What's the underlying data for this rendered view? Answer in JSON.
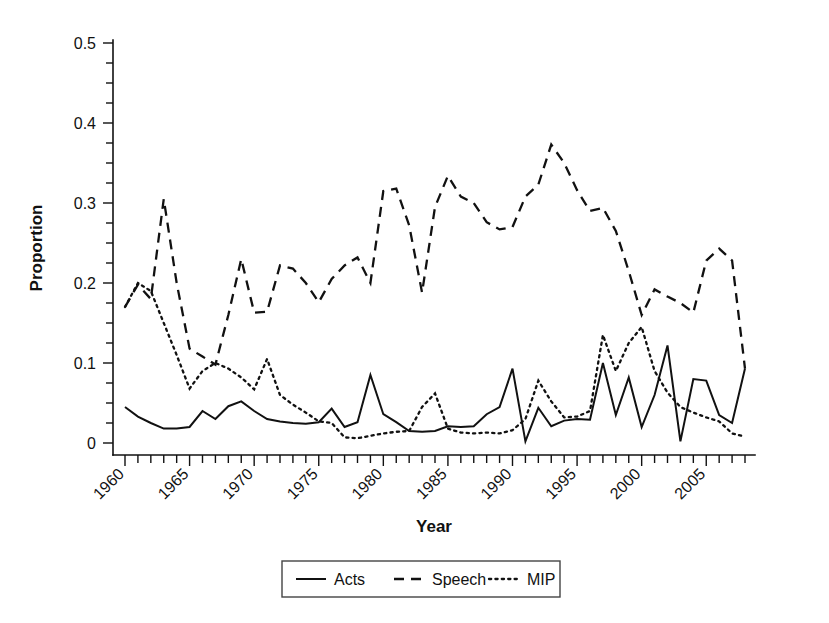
{
  "chart_data": {
    "type": "line",
    "title": "",
    "xlabel": "Year",
    "ylabel": "Proportion",
    "xlim": [
      1960,
      2008
    ],
    "ylim": [
      0,
      0.5
    ],
    "grid": false,
    "legend_position": "bottom",
    "y_ticks": [
      0,
      0.1,
      0.2,
      0.3,
      0.4,
      0.5
    ],
    "y_tick_labels": [
      "0",
      "0.1",
      "0.2",
      "0.3",
      "0.4",
      "0.5"
    ],
    "y_minor_tick_step": 0.025,
    "x_ticks": [
      1960,
      1965,
      1970,
      1975,
      1980,
      1985,
      1990,
      1995,
      2000,
      2005
    ],
    "x_tick_labels": [
      "1960",
      "1965",
      "1970",
      "1975",
      "1980",
      "1985",
      "1990",
      "1995",
      "2000",
      "2005"
    ],
    "x_tick_label_rotation": 45,
    "x_minor_tick_step": 1,
    "x": [
      1960,
      1961,
      1962,
      1963,
      1964,
      1965,
      1966,
      1967,
      1968,
      1969,
      1970,
      1971,
      1972,
      1973,
      1974,
      1975,
      1976,
      1977,
      1978,
      1979,
      1980,
      1981,
      1982,
      1983,
      1984,
      1985,
      1986,
      1987,
      1988,
      1989,
      1990,
      1991,
      1992,
      1993,
      1994,
      1995,
      1996,
      1997,
      1998,
      1999,
      2000,
      2001,
      2002,
      2003,
      2004,
      2005,
      2006,
      2007,
      2008
    ],
    "series": [
      {
        "name": "Acts",
        "style": "solid",
        "values": [
          0.045,
          0.033,
          0.025,
          0.018,
          0.018,
          0.02,
          0.04,
          0.03,
          0.046,
          0.052,
          0.04,
          0.03,
          0.027,
          0.025,
          0.024,
          0.026,
          0.043,
          0.02,
          0.026,
          0.085,
          0.036,
          0.026,
          0.015,
          0.014,
          0.015,
          0.021,
          0.02,
          0.021,
          0.036,
          0.045,
          0.093,
          0.002,
          0.044,
          0.021,
          0.028,
          0.03,
          0.029,
          0.1,
          0.035,
          0.082,
          0.02,
          0.06,
          0.122,
          0.002,
          0.08,
          0.078,
          0.035,
          0.025,
          0.093
        ]
      },
      {
        "name": "Speech",
        "style": "dashed",
        "values": [
          0.17,
          0.198,
          0.18,
          0.305,
          0.2,
          0.118,
          0.108,
          0.098,
          0.16,
          0.23,
          0.163,
          0.164,
          0.222,
          0.218,
          0.2,
          0.176,
          0.205,
          0.222,
          0.232,
          0.2,
          0.315,
          0.318,
          0.272,
          0.188,
          0.295,
          0.334,
          0.308,
          0.3,
          0.276,
          0.267,
          0.27,
          0.308,
          0.323,
          0.373,
          0.35,
          0.316,
          0.29,
          0.294,
          0.265,
          0.215,
          0.16,
          0.192,
          0.183,
          0.175,
          0.163,
          0.228,
          0.243,
          0.228,
          0.093
        ]
      },
      {
        "name": "MIP",
        "style": "dotted",
        "values": [
          0.17,
          0.2,
          0.19,
          0.15,
          0.11,
          0.068,
          0.09,
          0.1,
          0.093,
          0.082,
          0.067,
          0.105,
          0.06,
          0.048,
          0.038,
          0.027,
          0.025,
          0.007,
          0.006,
          0.009,
          0.012,
          0.014,
          0.015,
          0.045,
          0.062,
          0.018,
          0.013,
          0.012,
          0.013,
          0.012,
          0.016,
          0.03,
          0.078,
          0.052,
          0.032,
          0.033,
          0.04,
          0.135,
          0.09,
          0.125,
          0.145,
          0.09,
          0.063,
          0.045,
          0.038,
          0.032,
          0.027,
          0.012,
          0.008
        ]
      }
    ],
    "legend_entries": [
      {
        "label": "Acts",
        "style": "solid"
      },
      {
        "label": "Speech",
        "style": "dashed"
      },
      {
        "label": "MIP",
        "style": "dotted"
      }
    ]
  }
}
